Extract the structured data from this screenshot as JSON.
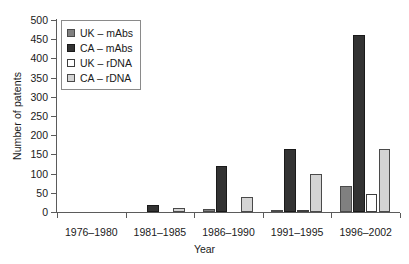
{
  "chart_data": {
    "type": "bar",
    "title": "",
    "xlabel": "Year",
    "ylabel": "Number of patents",
    "categories": [
      "1976–1980",
      "1981–1985",
      "1986–1990",
      "1991–1995",
      "1996–2002"
    ],
    "ylim": [
      0,
      500
    ],
    "ytick_step": 50,
    "yticks": [
      0,
      50,
      100,
      150,
      200,
      250,
      300,
      350,
      400,
      450,
      500
    ],
    "ytick_labels": [
      "0",
      "50",
      "100",
      "150",
      "200",
      "250",
      "300",
      "350",
      "400",
      "450",
      "500"
    ],
    "grid": false,
    "legend_position": "upper left",
    "series": [
      {
        "name": "UK – mAbs",
        "color": "#808080",
        "border": "#4a4a4a",
        "values": [
          0,
          0,
          8,
          3,
          68
        ]
      },
      {
        "name": "CA – mAbs",
        "color": "#333333",
        "border": "#1a1a1a",
        "values": [
          0,
          18,
          120,
          163,
          462
        ]
      },
      {
        "name": "UK – rDNA",
        "color": "#ffffff",
        "border": "#3d3d3d",
        "values": [
          0,
          0,
          0,
          3,
          48
        ]
      },
      {
        "name": "CA – rDNA",
        "color": "#d4d4d4",
        "border": "#4a4a4a",
        "values": [
          0,
          10,
          38,
          100,
          165
        ]
      }
    ]
  }
}
